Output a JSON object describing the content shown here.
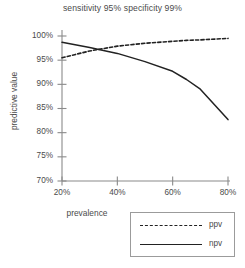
{
  "chart_data": {
    "type": "line",
    "title": "sensitivity 95% specificity 99%",
    "xlabel": "prevalence",
    "ylabel": "predictive value",
    "xlim": [
      20,
      80
    ],
    "ylim": [
      70,
      100
    ],
    "grid": false,
    "legend_position": "bottom-right-outside",
    "xticks": [
      "20%",
      "40%",
      "60%",
      "80%"
    ],
    "xtick_values": [
      20,
      40,
      60,
      80
    ],
    "yticks": [
      "70%",
      "75%",
      "80%",
      "85%",
      "90%",
      "95%",
      "100%"
    ],
    "ytick_values": [
      70,
      75,
      80,
      85,
      90,
      95,
      100
    ],
    "x": [
      20,
      30,
      35,
      40,
      50,
      60,
      65,
      70,
      80
    ],
    "series": [
      {
        "name": "ppv",
        "style": "dashed",
        "color": "#222222",
        "values": [
          95.5,
          96.9,
          97.4,
          97.9,
          98.5,
          98.9,
          99.1,
          99.2,
          99.5
        ]
      },
      {
        "name": "npv",
        "style": "solid",
        "color": "#222222",
        "values": [
          98.7,
          97.6,
          97.0,
          96.4,
          94.7,
          92.7,
          91.0,
          89.0,
          82.7
        ]
      }
    ]
  },
  "legend": {
    "items": [
      {
        "label": "ppv",
        "style": "dashed"
      },
      {
        "label": "npv",
        "style": "solid"
      }
    ]
  },
  "axis_color": "#8a8a8a",
  "line_color": "#222222"
}
